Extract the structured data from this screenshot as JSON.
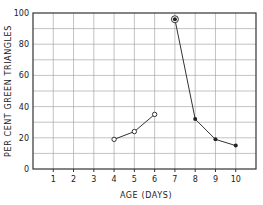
{
  "chart_data": {
    "type": "line",
    "title": "",
    "xlabel": "AGE (DAYS)",
    "ylabel": "PER CENT GREEN TRIANGLES",
    "xlim": [
      0,
      11
    ],
    "ylim": [
      0,
      100
    ],
    "x_ticks": [
      "1",
      "2",
      "3",
      "4",
      "5",
      "6",
      "7",
      "8",
      "9",
      "10"
    ],
    "y_ticks": [
      "0",
      "20",
      "40",
      "60",
      "80",
      "100"
    ],
    "grid": true,
    "series": [
      {
        "name": "open-circles",
        "marker": "open-circle",
        "x": [
          4,
          5,
          6
        ],
        "values": [
          19,
          24,
          35
        ]
      },
      {
        "name": "filled-circles",
        "marker": "filled-circle",
        "x": [
          7,
          8,
          9,
          10
        ],
        "values": [
          96,
          32,
          19,
          15
        ]
      }
    ]
  }
}
